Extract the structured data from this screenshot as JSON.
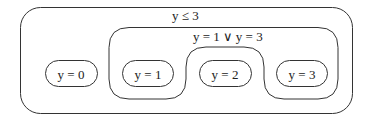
{
  "diagram": {
    "outer_region": {
      "label": "y ≤ 3"
    },
    "inner_region": {
      "label": "y = 1 ∨ y = 3"
    },
    "nodes": [
      {
        "label": "y = 0"
      },
      {
        "label": "y = 1"
      },
      {
        "label": "y = 2"
      },
      {
        "label": "y = 3"
      }
    ],
    "colors": {
      "stroke": "#333333",
      "background": "#ffffff",
      "text": "#222222"
    }
  }
}
